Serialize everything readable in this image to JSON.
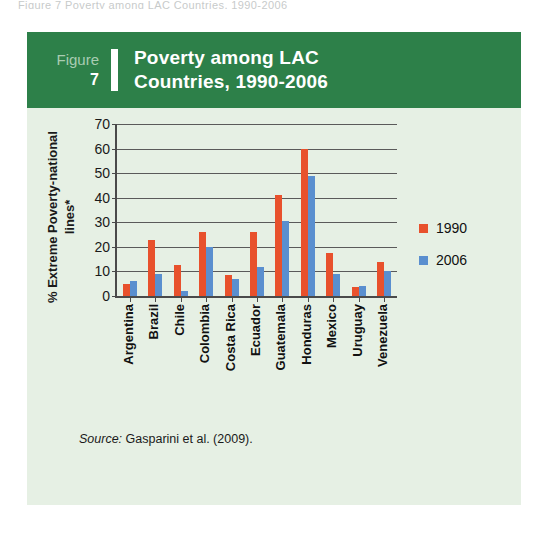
{
  "scan_sliver_text": "Figure 7  Poverty among LAC Countries, 1990-2006",
  "figure": {
    "label_word": "Figure",
    "number": "7",
    "title_line1": "Poverty among LAC",
    "title_line2": "Countries, 1990-2006",
    "header_bg": "#2d8049",
    "card_bg": "#e6f0e4"
  },
  "source": {
    "prefix": "Source:",
    "text": " Gasparini et al. (2009)."
  },
  "legend": {
    "items": [
      {
        "label": "1990",
        "color": "#e8512c"
      },
      {
        "label": "2006",
        "color": "#5a8fcf"
      }
    ]
  },
  "chart_data": {
    "type": "bar",
    "title": "Poverty among LAC Countries, 1990-2006",
    "xlabel": "",
    "ylabel": "% Extreme Poverty-national lines*",
    "ylim": [
      0,
      70
    ],
    "ytick_step": 10,
    "yticks": [
      0,
      10,
      20,
      30,
      40,
      50,
      60,
      70
    ],
    "grid": true,
    "legend_position": "right",
    "categories": [
      "Argentina",
      "Brazil",
      "Chile",
      "Colombia",
      "Costa Rica",
      "Ecuador",
      "Guatemala",
      "Honduras",
      "Mexico",
      "Uruguay",
      "Venezuela"
    ],
    "series": [
      {
        "name": "1990",
        "color": "#e8512c",
        "values": [
          5,
          23,
          12.5,
          26,
          8.5,
          26,
          41,
          60,
          17.5,
          3.5,
          14
        ]
      },
      {
        "name": "2006",
        "color": "#5a8fcf",
        "values": [
          6,
          9,
          2,
          20,
          7,
          12,
          30.5,
          49,
          9,
          4,
          10
        ]
      }
    ]
  }
}
